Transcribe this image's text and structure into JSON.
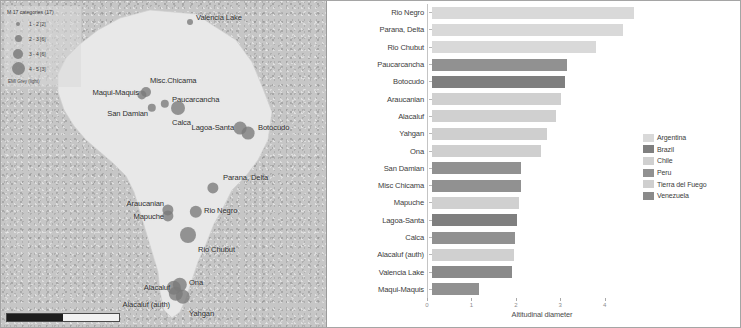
{
  "map": {
    "legend": {
      "title": "M 17 categories (17)",
      "footer": "EMI Grey (light)",
      "bins": [
        {
          "label": "1 - 2 [2]",
          "size": 4
        },
        {
          "label": "2 - 3 [6]",
          "size": 7
        },
        {
          "label": "3 - 4 [6]",
          "size": 10
        },
        {
          "label": "4 - 5 [3]",
          "size": 13
        }
      ]
    },
    "points": [
      {
        "name": "Valencia Lake",
        "x": 190,
        "y": 22,
        "r": 3.0,
        "label_side": "right",
        "lx": 196,
        "ly": 17
      },
      {
        "name": "Misc.Chicama",
        "x": 146,
        "y": 92,
        "r": 5.0,
        "label_side": "right",
        "lx": 150,
        "ly": 80
      },
      {
        "name": "Maqui-Maquis",
        "x": 142,
        "y": 95,
        "r": 4.6,
        "label_side": "left",
        "lx": 139,
        "ly": 92
      },
      {
        "name": "Paucarcancha",
        "x": 165,
        "y": 104,
        "r": 4.2,
        "label_side": "right",
        "lx": 172,
        "ly": 99
      },
      {
        "name": "San Damian",
        "x": 152,
        "y": 108,
        "r": 4.2,
        "label_side": "left",
        "lx": 148,
        "ly": 113
      },
      {
        "name": "Calca",
        "x": 178,
        "y": 108,
        "r": 7.0,
        "label_side": "right",
        "lx": 172,
        "ly": 122
      },
      {
        "name": "Lagoa-Santa",
        "x": 240,
        "y": 128,
        "r": 6.4,
        "label_side": "left",
        "lx": 234,
        "ly": 127
      },
      {
        "name": "Botocudo",
        "x": 248,
        "y": 133,
        "r": 6.4,
        "label_side": "right",
        "lx": 258,
        "ly": 127
      },
      {
        "name": "Parana, Delta",
        "x": 213,
        "y": 188,
        "r": 5.6,
        "label_side": "right",
        "lx": 223,
        "ly": 177
      },
      {
        "name": "Rio Negro",
        "x": 196,
        "y": 212,
        "r": 6.2,
        "label_side": "right",
        "lx": 204,
        "ly": 210
      },
      {
        "name": "Araucanian",
        "x": 168,
        "y": 210,
        "r": 5.6,
        "label_side": "left",
        "lx": 164,
        "ly": 203
      },
      {
        "name": "Mapuche",
        "x": 168,
        "y": 216,
        "r": 5.6,
        "label_side": "left",
        "lx": 164,
        "ly": 216
      },
      {
        "name": "Rio Chubut",
        "x": 188,
        "y": 235,
        "r": 8.0,
        "label_side": "right",
        "lx": 198,
        "ly": 249
      },
      {
        "name": "Ona",
        "x": 180,
        "y": 285,
        "r": 7.2,
        "label_side": "right",
        "lx": 189,
        "ly": 282
      },
      {
        "name": "Alacaluf",
        "x": 174,
        "y": 288,
        "r": 7.2,
        "label_side": "left",
        "lx": 170,
        "ly": 287
      },
      {
        "name": "Alacaluf (auth)",
        "x": 176,
        "y": 294,
        "r": 7.2,
        "label_side": "left",
        "lx": 170,
        "ly": 304
      },
      {
        "name": "Yahgan",
        "x": 183,
        "y": 297,
        "r": 7.2,
        "label_side": "right",
        "lx": 189,
        "ly": 313
      }
    ],
    "scalebar": {
      "present": true
    }
  },
  "chart_data": {
    "type": "bar",
    "orientation": "horizontal",
    "title": "",
    "xlabel": "Altitudinal diameter",
    "ylabel": "",
    "xlim": [
      0,
      5
    ],
    "xticks": [
      0,
      1,
      2,
      3,
      4
    ],
    "xtick_labels": [
      "0",
      "1",
      "2",
      "3",
      "4"
    ],
    "grid": false,
    "legend_position": "right",
    "categories": [
      "Rio Negro",
      "Parana, Delta",
      "Rio Chubut",
      "Paucarcancha",
      "Botocudo",
      "Araucanian",
      "Alacaluf",
      "Yahgan",
      "Ona",
      "San Damian",
      "Misc Chicama",
      "Mapuche",
      "Lagoa-Santa",
      "Calca",
      "Alacaluf (auth)",
      "Valencia Lake",
      "Maqui-Maquis"
    ],
    "values": [
      4.55,
      4.3,
      3.7,
      3.05,
      3.0,
      2.9,
      2.8,
      2.6,
      2.45,
      2.0,
      2.0,
      1.95,
      1.92,
      1.88,
      1.85,
      1.8,
      1.05
    ],
    "groups": [
      "Argentina",
      "Argentina",
      "Argentina",
      "Peru",
      "Brazil",
      "Chile",
      "Chile",
      "Tierra del Fuego",
      "Tierra del Fuego",
      "Peru",
      "Peru",
      "Chile",
      "Brazil",
      "Peru",
      "Chile",
      "Venezuela",
      "Peru"
    ],
    "legend": [
      {
        "name": "Argentina",
        "color": "#d9d9d9"
      },
      {
        "name": "Brazil",
        "color": "#7f7f7f"
      },
      {
        "name": "Chile",
        "color": "#d0d0d0"
      },
      {
        "name": "Peru",
        "color": "#919191"
      },
      {
        "name": "Tierra del Fuego",
        "color": "#cfcfcf"
      },
      {
        "name": "Venezuela",
        "color": "#8a8a8a"
      }
    ]
  }
}
